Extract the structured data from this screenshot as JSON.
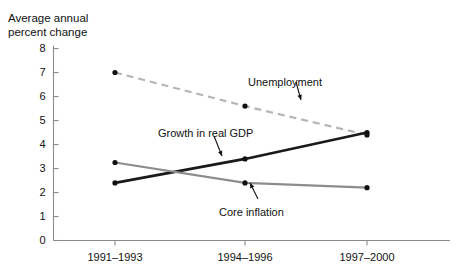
{
  "figure": {
    "axis_title_line1": "Average annual",
    "axis_title_line2": "percent change",
    "background_color": "#ffffff"
  },
  "chart_data": {
    "type": "line",
    "title": "",
    "xlabel": "",
    "ylabel": "Average annual percent change",
    "categories": [
      "1991–1993",
      "1994–1996",
      "1997–2000"
    ],
    "ylim": [
      0,
      8
    ],
    "yticks": [
      0,
      1,
      2,
      3,
      4,
      5,
      6,
      7,
      8
    ],
    "ytick_labels": [
      "0",
      "1",
      "2",
      "3",
      "4",
      "5",
      "6",
      "7",
      "8"
    ],
    "grid": false,
    "legend": "inline-annotations",
    "series": [
      {
        "name": "Unemployment",
        "values": [
          7.0,
          5.6,
          4.4
        ],
        "color": "#b4b4b4",
        "style": "dashed",
        "width": 2.2,
        "markers": true
      },
      {
        "name": "Growth in real GDP",
        "values": [
          2.4,
          3.4,
          4.5
        ],
        "color": "#1a1a1a",
        "style": "solid",
        "width": 2.6,
        "markers": true
      },
      {
        "name": "Core inflation",
        "values": [
          3.25,
          2.4,
          2.2
        ],
        "color": "#8c8c8c",
        "style": "solid",
        "width": 2.2,
        "markers": true
      }
    ],
    "annotations": [
      {
        "text": "Unemployment",
        "x": 248,
        "y": 76
      },
      {
        "text": "Growth in real GDP",
        "x": 158,
        "y": 127
      },
      {
        "text": "Core inflation",
        "x": 219,
        "y": 206
      }
    ]
  }
}
